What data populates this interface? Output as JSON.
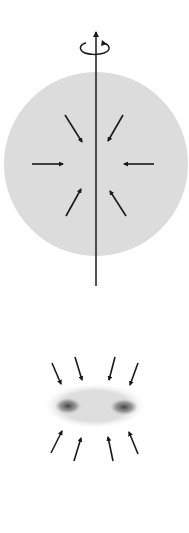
{
  "diagram": {
    "colors": {
      "background": "#ffffff",
      "cloud_fill": "#dcdcdc",
      "arrow": "#1a1a1a",
      "blob_core": "#505050",
      "disk_haze": "#c8c8c8"
    },
    "stage_1": {
      "shape": "sphere",
      "center": [
        96,
        164
      ],
      "radius": 92,
      "axis": {
        "x": 96,
        "y_top": 28,
        "y_bottom": 286
      },
      "rotation_icon": "counterclockwise-rotation-arrow",
      "inflow_arrows": 6
    },
    "stage_2": {
      "shape": "flattened-disk",
      "center": [
        94,
        407
      ],
      "blobs": [
        [
          68,
          406
        ],
        [
          124,
          407
        ]
      ],
      "inflow_arrows_top": 4,
      "inflow_arrows_bottom": 4
    }
  }
}
